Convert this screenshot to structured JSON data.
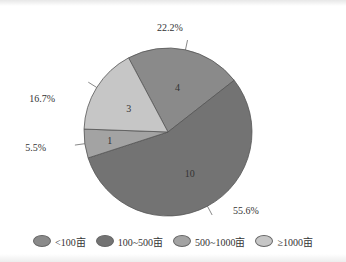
{
  "chart_data": {
    "type": "pie",
    "title": "",
    "categories": [
      "<100亩",
      "100~500亩",
      "500~1000亩",
      "≥1000亩"
    ],
    "values": [
      4,
      10,
      1,
      3
    ],
    "percentages": [
      "22.2%",
      "55.6%",
      "5.5%",
      "16.7%"
    ],
    "colors": [
      "#8a8a8a",
      "#737373",
      "#a3a3a3",
      "#c6c6c6"
    ],
    "legend_position": "bottom"
  },
  "slices": [
    {
      "count": "4",
      "pct": "22.2%"
    },
    {
      "count": "10",
      "pct": "55.6%"
    },
    {
      "count": "1",
      "pct": "5.5%"
    },
    {
      "count": "3",
      "pct": "16.7%"
    }
  ],
  "legend": [
    {
      "label": "<100亩",
      "color": "#8a8a8a"
    },
    {
      "label": "100~500亩",
      "color": "#737373"
    },
    {
      "label": "500~1000亩",
      "color": "#a3a3a3"
    },
    {
      "label": "≥1000亩",
      "color": "#c6c6c6"
    }
  ]
}
